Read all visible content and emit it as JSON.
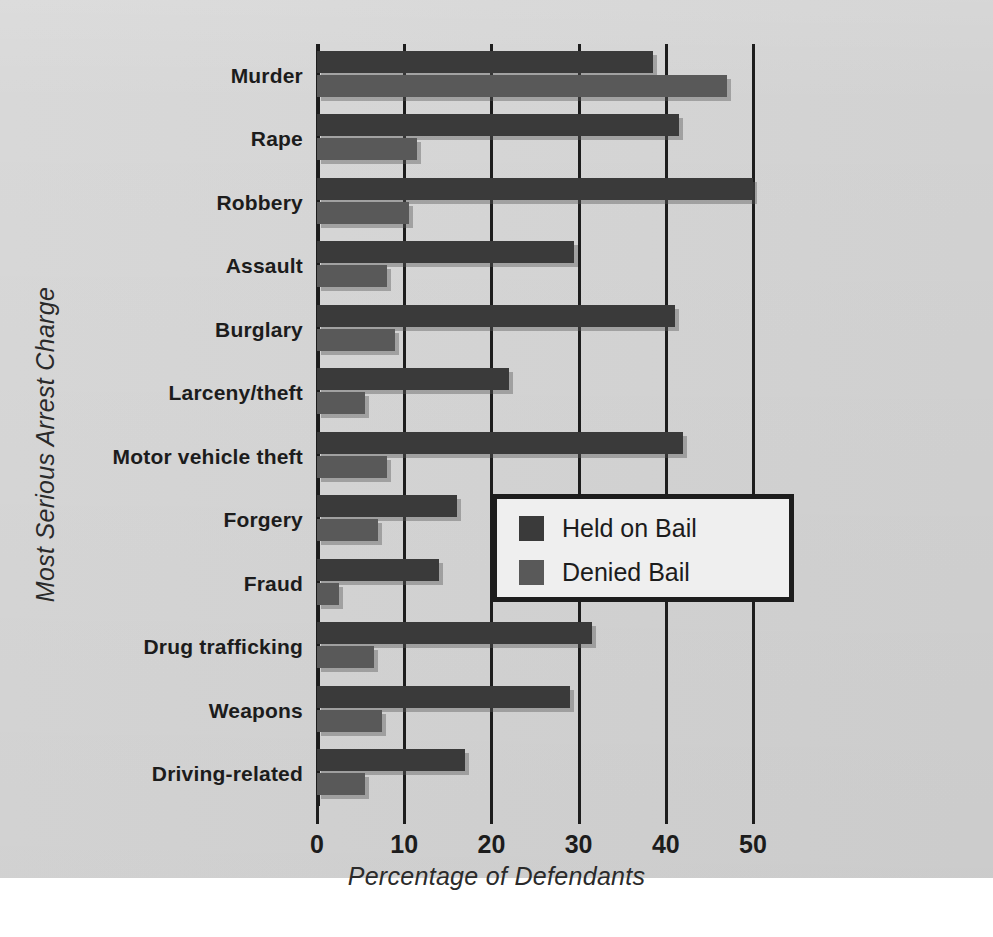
{
  "chart_data": {
    "type": "bar",
    "orientation": "horizontal",
    "title": "",
    "xlabel": "Percentage of Defendants",
    "ylabel": "Most Serious Arrest Charge",
    "xlim": [
      0,
      50
    ],
    "xticks": [
      0,
      10,
      20,
      30,
      40,
      50
    ],
    "xtick_labels": [
      "0",
      "10",
      "20",
      "30",
      "40",
      "50"
    ],
    "grid": true,
    "grid_axis": "x",
    "legend_position": "center-right",
    "categories": [
      "Murder",
      "Rape",
      "Robbery",
      "Assault",
      "Burglary",
      "Larceny/theft",
      "Motor vehicle theft",
      "Forgery",
      "Fraud",
      "Drug trafficking",
      "Weapons",
      "Driving-related"
    ],
    "series": [
      {
        "name": "Held on Bail",
        "color": "#3a3a3a",
        "values": [
          38.5,
          41.5,
          50.0,
          29.5,
          41.0,
          22.0,
          42.0,
          16.0,
          14.0,
          31.5,
          29.0,
          17.0
        ]
      },
      {
        "name": "Denied Bail",
        "color": "#595959",
        "values": [
          47.0,
          11.5,
          10.5,
          8.0,
          9.0,
          5.5,
          8.0,
          7.0,
          2.5,
          6.5,
          7.5,
          5.5
        ]
      }
    ]
  },
  "legend": {
    "items": [
      {
        "label": "Held on Bail",
        "color": "#3a3a3a"
      },
      {
        "label": "Denied Bail",
        "color": "#595959"
      }
    ]
  },
  "colors": {
    "page_background": "#d6d6d6",
    "axis": "#1d1d1d",
    "held_on_bail": "#3a3a3a",
    "denied_bail": "#595959",
    "legend_background": "#efefef",
    "text": "#1c1c1c"
  }
}
